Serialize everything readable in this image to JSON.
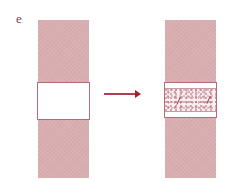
{
  "panel": {
    "label": "e"
  },
  "diagram": {
    "left_strip": {
      "state": "before",
      "window": "empty"
    },
    "right_strip": {
      "state": "after",
      "window": "filled-speckled"
    },
    "arrow": "right",
    "colors": {
      "strip": "#d9aeb1",
      "window_border": "#b86b76",
      "arrow": "#b0404e",
      "label": "#8c3b4a"
    }
  }
}
